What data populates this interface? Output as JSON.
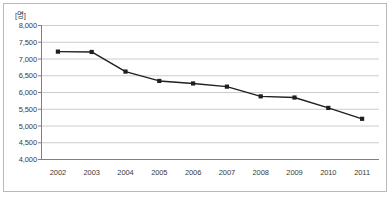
{
  "chart_data": {
    "type": "line",
    "title": "",
    "subtitle": "",
    "unit_label": "[명]",
    "xlabel": "",
    "ylabel": "",
    "categories": [
      "2002",
      "2003",
      "2004",
      "2005",
      "2006",
      "2007",
      "2008",
      "2009",
      "2010",
      "2011"
    ],
    "values": [
      7205,
      7195,
      6610,
      6330,
      6255,
      6160,
      5870,
      5835,
      5525,
      5200
    ],
    "series": [
      {
        "name": "",
        "values": [
          7205,
          7195,
          6610,
          6330,
          6255,
          6160,
          5870,
          5835,
          5525,
          5200
        ]
      }
    ],
    "ylim": [
      4000,
      8000
    ],
    "y_ticks": [
      8000,
      7500,
      7000,
      6500,
      6000,
      5500,
      5000,
      4500,
      4000
    ],
    "y_tick_labels": [
      "8,000",
      "7,500",
      "7,000",
      "6,500",
      "6,000",
      "5,500",
      "5,000",
      "4,500",
      "4,000"
    ],
    "grid": true,
    "legend": false,
    "legend_position": "none",
    "line_color": "#1f1f1f",
    "marker_color": "#1f1f1f",
    "marker_shape": "square",
    "grid_color": "#cccccc",
    "axis_color": "#808080",
    "border_color": "#b9b9b9",
    "text_color": "#3a3a3a"
  }
}
